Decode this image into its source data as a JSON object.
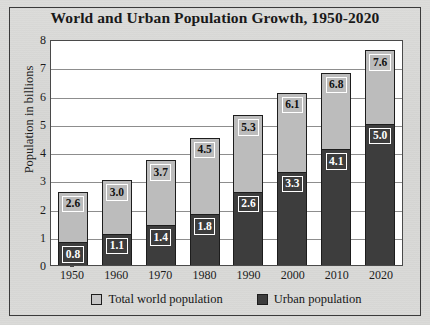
{
  "chart_data": {
    "type": "bar",
    "subtype": "stacked-bar",
    "title": "World and Urban Population Growth, 1950-2020",
    "xlabel": "",
    "ylabel": "Population in billions",
    "categories": [
      "1950",
      "1960",
      "1970",
      "1980",
      "1990",
      "2000",
      "2010",
      "2020"
    ],
    "series": [
      {
        "name": "Total world population",
        "color": "#bcbcbc",
        "values": [
          2.6,
          3.0,
          3.7,
          4.5,
          5.3,
          6.1,
          6.8,
          7.6
        ],
        "labels": [
          "2.6",
          "3.0",
          "3.7",
          "4.5",
          "5.3",
          "6.1",
          "6.8",
          "7.6"
        ]
      },
      {
        "name": "Urban population",
        "color": "#3d3d3d",
        "values": [
          0.8,
          1.1,
          1.4,
          1.8,
          2.6,
          3.3,
          4.1,
          5.0
        ],
        "labels": [
          "0.8",
          "1.1",
          "1.4",
          "1.8",
          "2.6",
          "3.3",
          "4.1",
          "5.0"
        ]
      }
    ],
    "ylim": [
      0,
      8
    ],
    "yticks": [
      "0",
      "1",
      "2",
      "3",
      "4",
      "5",
      "6",
      "7",
      "8"
    ],
    "grid": true,
    "legend_position": "bottom"
  },
  "legend": {
    "items": [
      {
        "label": "Total world population",
        "swatch": "total"
      },
      {
        "label": "Urban population",
        "swatch": "urban"
      }
    ]
  },
  "colors": {
    "total_fill": "#bcbcbc",
    "urban_fill": "#3d3d3d",
    "plot_background": "#ffffff",
    "paper_background": "#d9d9d7",
    "axis": "#4a4a4a",
    "gridline": "#8d8d8d"
  }
}
